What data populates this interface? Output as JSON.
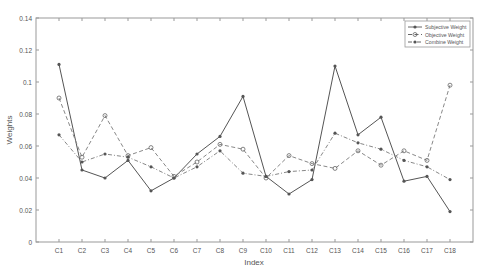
{
  "chart_data": {
    "type": "line",
    "title": "",
    "xlabel": "Index",
    "ylabel": "Weights",
    "ylim": [
      0,
      0.14
    ],
    "yticks": [
      "0",
      "0.02",
      "0.04",
      "0.06",
      "0.08",
      "0.1",
      "0.12",
      "0.14"
    ],
    "grid": false,
    "legend_position": "top-right",
    "categories": [
      "C1",
      "C2",
      "C3",
      "C4",
      "C5",
      "C6",
      "C7",
      "C8",
      "C9",
      "C10",
      "C11",
      "C12",
      "C13",
      "C14",
      "C15",
      "C16",
      "C17",
      "C18"
    ],
    "series": [
      {
        "name": "Subjective Weight",
        "style": "solid",
        "marker": "asterisk",
        "values": [
          0.111,
          0.045,
          0.04,
          0.051,
          0.032,
          0.04,
          0.055,
          0.066,
          0.091,
          0.041,
          0.03,
          0.039,
          0.11,
          0.067,
          0.078,
          0.038,
          0.041,
          0.019
        ]
      },
      {
        "name": "Objective Weight",
        "style": "dashed",
        "marker": "circle",
        "values": [
          0.09,
          0.053,
          0.079,
          0.054,
          0.059,
          0.041,
          0.05,
          0.061,
          0.058,
          0.04,
          0.054,
          0.049,
          0.046,
          0.057,
          0.048,
          0.057,
          0.051,
          0.098
        ]
      },
      {
        "name": "Combine Weight",
        "style": "dash-dot",
        "marker": "asterisk",
        "values": [
          0.067,
          0.05,
          0.055,
          0.053,
          0.047,
          0.04,
          0.047,
          0.057,
          0.043,
          0.041,
          0.044,
          0.045,
          0.068,
          0.062,
          0.058,
          0.051,
          0.047,
          0.039
        ]
      }
    ]
  },
  "colors": {
    "axis": "#888888",
    "series": "#666666",
    "text": "#555555"
  }
}
